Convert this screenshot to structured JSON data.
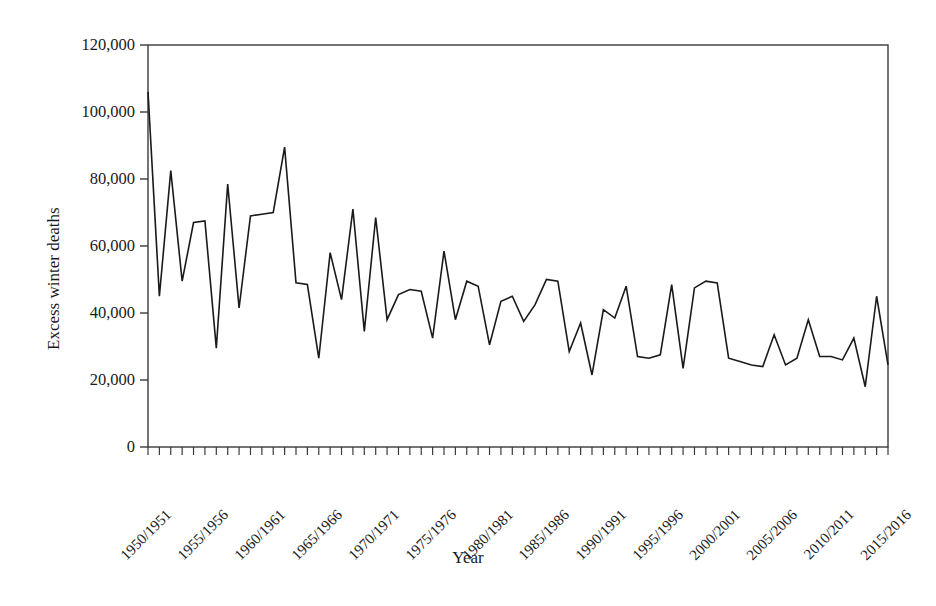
{
  "chart_data": {
    "type": "line",
    "title": "",
    "xlabel": "Year",
    "ylabel": "Excess winter deaths",
    "ylim": [
      0,
      120000
    ],
    "xlim_labels": [
      "1950/1951",
      "2015/2016"
    ],
    "grid": false,
    "legend": "none",
    "y_ticks": [
      0,
      20000,
      40000,
      60000,
      80000,
      100000,
      120000
    ],
    "y_tick_labels": [
      "0",
      "20,000",
      "40,000",
      "60,000",
      "80,000",
      "100,000",
      "120,000"
    ],
    "x_tick_labels": [
      "1950/1951",
      "1955/1956",
      "1960/1961",
      "1965/1966",
      "1970/1971",
      "1975/1976",
      "1980/1981",
      "1985/1986",
      "1990/1991",
      "1995/1996",
      "2000/2001",
      "2005/2006",
      "2010/2011",
      "2015/2016"
    ],
    "x_tick_label_indices": [
      0,
      5,
      10,
      15,
      20,
      25,
      30,
      35,
      40,
      45,
      50,
      55,
      60,
      65
    ],
    "categories": [
      "1950/1951",
      "1951/1952",
      "1952/1953",
      "1953/1954",
      "1954/1955",
      "1955/1956",
      "1956/1957",
      "1957/1958",
      "1958/1959",
      "1959/1960",
      "1960/1961",
      "1961/1962",
      "1962/1963",
      "1963/1964",
      "1964/1965",
      "1965/1966",
      "1966/1967",
      "1967/1968",
      "1968/1969",
      "1969/1970",
      "1970/1971",
      "1971/1972",
      "1972/1973",
      "1973/1974",
      "1974/1975",
      "1975/1976",
      "1976/1977",
      "1977/1978",
      "1978/1979",
      "1979/1980",
      "1980/1981",
      "1981/1982",
      "1982/1983",
      "1983/1984",
      "1984/1985",
      "1985/1986",
      "1986/1987",
      "1987/1988",
      "1988/1989",
      "1989/1990",
      "1990/1991",
      "1991/1992",
      "1992/1993",
      "1993/1994",
      "1994/1995",
      "1995/1996",
      "1996/1997",
      "1997/1998",
      "1998/1999",
      "1999/2000",
      "2000/2001",
      "2001/2002",
      "2002/2003",
      "2003/2004",
      "2004/2005",
      "2005/2006",
      "2006/2007",
      "2007/2008",
      "2008/2009",
      "2009/2010",
      "2010/2011",
      "2011/2012",
      "2012/2013",
      "2013/2014",
      "2014/2015",
      "2015/2016"
    ],
    "series": [
      {
        "name": "Excess winter deaths",
        "color": "#1a1a1a",
        "values": [
          106000,
          45000,
          82500,
          49500,
          67000,
          67500,
          29500,
          78500,
          41500,
          69000,
          69500,
          70000,
          89500,
          49000,
          48500,
          26500,
          58000,
          44000,
          71000,
          34500,
          68500,
          38000,
          45500,
          47000,
          46500,
          32500,
          58500,
          38000,
          49500,
          48000,
          30500,
          43500,
          45000,
          37500,
          42500,
          50000,
          49500,
          28500,
          37000,
          21500,
          41000,
          38500,
          48000,
          27000,
          26500,
          27500,
          48500,
          23500,
          47500,
          49500,
          49000,
          26500,
          25500,
          24500,
          24000,
          33500,
          24500,
          26500,
          38000,
          27000,
          27000,
          26000,
          32500,
          18000,
          45000,
          24500
        ]
      }
    ]
  },
  "axes": {
    "plot_left_px": 148,
    "plot_right_px": 888,
    "plot_top_px": 45,
    "plot_bottom_px": 447
  }
}
